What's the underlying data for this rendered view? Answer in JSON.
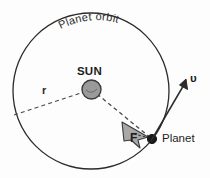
{
  "figure": {
    "background_color": "#fdfdfd",
    "width": 210,
    "height": 178
  },
  "labels": {
    "orbit": "Planet orbit",
    "sun": "SUN",
    "planet": "Planet",
    "force": "F",
    "radius": "r",
    "velocity": "υ"
  },
  "colors": {
    "stroke": "#2b2b2b",
    "sun_fill": "#9a9a9a",
    "sun_stroke": "#3a3a3a",
    "arrow_fill": "#a8a8a8",
    "arrow_stroke": "#3a3a3a",
    "planet_fill": "#1a1a1a",
    "dashed": "#4a4a4a",
    "text": "#1d1d1d"
  },
  "geometry": {
    "orbit_center_x": 91,
    "orbit_center_y": 91,
    "orbit_radius": 78,
    "sun_center_x": 91.5,
    "sun_center_y": 89.5,
    "sun_radius": 9.5,
    "planet_x": 152,
    "planet_y": 139,
    "planet_radius": 4.5,
    "radius_line_start_x": 14,
    "radius_line_start_y": 115,
    "velocity_tip_x": 186,
    "velocity_tip_y": 82
  },
  "elements": {
    "orbit_circle": "orbit-circle",
    "sun_body": "sun-body",
    "planet_body": "planet-body",
    "force_arrow": "force-arrow",
    "velocity_arrow": "velocity-arrow",
    "radius_line": "radius-dashed-line"
  }
}
